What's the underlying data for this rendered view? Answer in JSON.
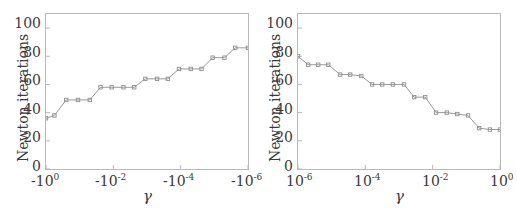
{
  "figure": {
    "background": "#ffffff",
    "axis_color": "#b9b9b9",
    "line_color": "#9a9a9a",
    "marker_color": "#8f8f8f",
    "text_color": "#3a3a3a"
  },
  "panels": [
    {
      "id": "left",
      "ylabel": "Newton iterations",
      "xlabel": "γ",
      "ytick_labels": [
        "0",
        "20",
        "40",
        "60",
        "80",
        "100"
      ],
      "xtick_labels": [
        "-10",
        "-10",
        "-10",
        "-10"
      ],
      "xtick_exponents": [
        "0",
        "-2",
        "-4",
        "-6"
      ]
    },
    {
      "id": "right",
      "ylabel": "Newton iterations",
      "xlabel": "γ",
      "ytick_labels": [
        "0",
        "20",
        "40",
        "60",
        "80",
        "100"
      ],
      "xtick_labels": [
        "10",
        "10",
        "10",
        "10"
      ],
      "xtick_exponents": [
        "-6",
        "-4",
        "-2",
        "0"
      ]
    }
  ],
  "chart_data": [
    {
      "type": "line",
      "id": "left-chart",
      "title": "",
      "xlabel": "γ",
      "ylabel": "Newton iterations",
      "xscale": "negative-log",
      "xlim": [
        0,
        6
      ],
      "ylim": [
        0,
        110
      ],
      "yticks": [
        0,
        20,
        40,
        60,
        80,
        100
      ],
      "xticks": [
        0,
        2,
        4,
        6
      ],
      "xtick_labels": [
        "-10^0",
        "-10^-2",
        "-10^-4",
        "-10^-6"
      ],
      "grid": false,
      "legend": "none",
      "markers": "square",
      "x": [
        0.0,
        0.25,
        0.6,
        0.95,
        1.3,
        1.62,
        1.95,
        2.3,
        2.62,
        2.95,
        3.3,
        3.62,
        3.95,
        4.3,
        4.62,
        4.95,
        5.3,
        5.62,
        6.0
      ],
      "values": [
        36,
        38,
        49,
        49,
        49,
        58,
        58,
        58,
        58,
        64,
        64,
        64,
        71,
        71,
        71,
        79,
        79,
        86,
        86
      ]
    },
    {
      "type": "line",
      "id": "right-chart",
      "title": "",
      "xlabel": "γ",
      "ylabel": "Newton iterations",
      "xscale": "log",
      "xlim": [
        -6,
        0
      ],
      "ylim": [
        0,
        110
      ],
      "yticks": [
        0,
        20,
        40,
        60,
        80,
        100
      ],
      "xticks": [
        -6,
        -4,
        -2,
        0
      ],
      "xtick_labels": [
        "10^-6",
        "10^-4",
        "10^-2",
        "10^0"
      ],
      "grid": false,
      "legend": "none",
      "markers": "square",
      "x": [
        -6.0,
        -5.7,
        -5.4,
        -5.1,
        -4.75,
        -4.45,
        -4.12,
        -3.8,
        -3.5,
        -3.18,
        -2.85,
        -2.55,
        -2.22,
        -1.9,
        -1.58,
        -1.27,
        -0.95,
        -0.62,
        -0.3,
        0.0
      ],
      "values": [
        80,
        74,
        74,
        74,
        67,
        67,
        66,
        60,
        60,
        60,
        60,
        51,
        51,
        40,
        40,
        39,
        38,
        29,
        28,
        28
      ]
    }
  ]
}
